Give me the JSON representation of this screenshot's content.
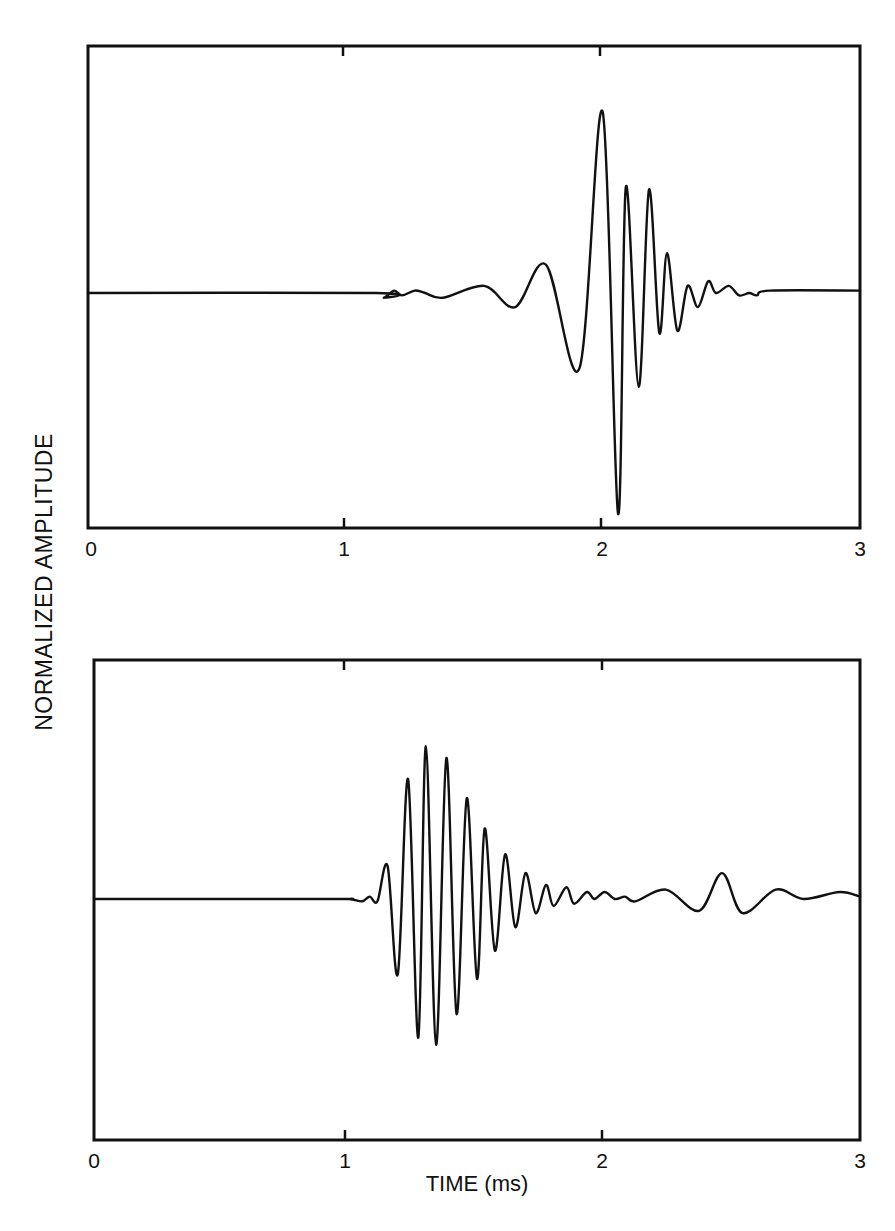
{
  "figure": {
    "ylabel": "NORMALIZED  AMPLITUDE",
    "xlabel": "TIME (ms)"
  },
  "panels": [
    {
      "id": "top",
      "tick_labels": [
        "0",
        "1",
        "2",
        "3"
      ]
    },
    {
      "id": "bottom",
      "tick_labels": [
        "0",
        "1",
        "2",
        "3"
      ]
    }
  ],
  "chart_data": [
    {
      "type": "line",
      "title": "",
      "xlabel": "TIME (ms)",
      "ylabel": "NORMALIZED AMPLITUDE",
      "xlim": [
        0,
        3
      ],
      "ylim": [
        -1.02,
        1.02
      ],
      "xticks": [
        0,
        1,
        2,
        3
      ],
      "grid": false,
      "legend": null,
      "series": [
        {
          "name": "top waveform",
          "x": [
            0.0,
            1.12,
            1.15,
            1.19,
            1.22,
            1.27,
            1.31,
            1.38,
            1.54,
            1.66,
            1.78,
            1.91,
            2.0,
            2.06,
            2.09,
            2.14,
            2.18,
            2.22,
            2.25,
            2.29,
            2.33,
            2.37,
            2.41,
            2.44,
            2.49,
            2.53,
            2.57,
            2.6,
            2.65,
            3.0
          ],
          "y": [
            0.0,
            0.0,
            -0.02,
            0.01,
            -0.01,
            0.01,
            0.0,
            -0.02,
            0.03,
            -0.06,
            0.12,
            -0.32,
            0.77,
            -0.94,
            0.45,
            -0.4,
            0.44,
            -0.17,
            0.17,
            -0.16,
            0.03,
            -0.06,
            0.05,
            0.0,
            0.03,
            -0.01,
            0.0,
            -0.01,
            0.01,
            0.01
          ]
        }
      ]
    },
    {
      "type": "line",
      "title": "",
      "xlabel": "TIME (ms)",
      "ylabel": "NORMALIZED AMPLITUDE",
      "xlim": [
        0,
        3
      ],
      "ylim": [
        -1.02,
        1.02
      ],
      "xticks": [
        0,
        1,
        2,
        3
      ],
      "grid": false,
      "legend": null,
      "series": [
        {
          "name": "bottom waveform",
          "x": [
            0.0,
            0.92,
            1.0,
            1.05,
            1.08,
            1.11,
            1.15,
            1.19,
            1.23,
            1.27,
            1.3,
            1.34,
            1.38,
            1.42,
            1.46,
            1.5,
            1.53,
            1.57,
            1.61,
            1.65,
            1.69,
            1.73,
            1.77,
            1.8,
            1.85,
            1.88,
            1.93,
            1.96,
            2.0,
            2.04,
            2.08,
            2.12,
            2.24,
            2.37,
            2.46,
            2.54,
            2.67,
            2.78,
            2.92,
            3.0
          ],
          "y": [
            0.0,
            0.0,
            0.0,
            -0.01,
            0.01,
            -0.01,
            0.14,
            -0.32,
            0.51,
            -0.59,
            0.65,
            -0.62,
            0.6,
            -0.49,
            0.43,
            -0.34,
            0.3,
            -0.22,
            0.19,
            -0.12,
            0.11,
            -0.06,
            0.06,
            -0.03,
            0.05,
            -0.02,
            0.03,
            0.0,
            0.03,
            0.0,
            0.01,
            -0.01,
            0.04,
            -0.05,
            0.11,
            -0.06,
            0.04,
            0.0,
            0.03,
            0.01
          ]
        }
      ]
    }
  ]
}
